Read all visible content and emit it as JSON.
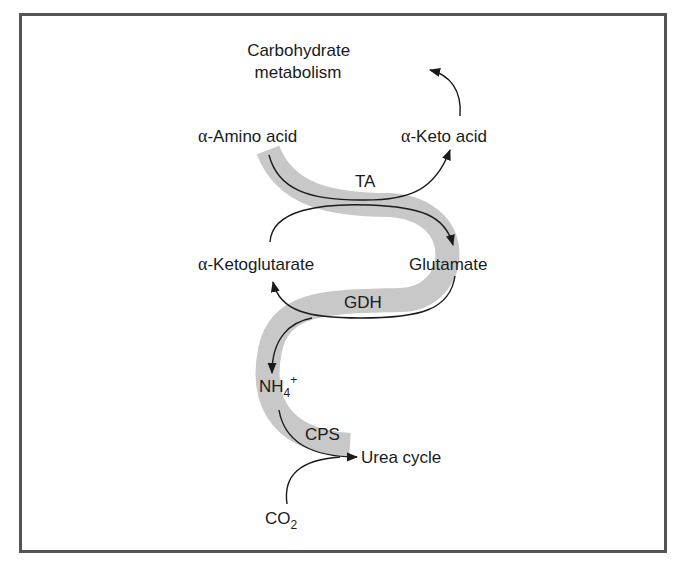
{
  "diagram": {
    "labels": {
      "carbohydrate_line1": "Carbohydrate",
      "carbohydrate_line2": "metabolism",
      "amino_acid_alpha": "α",
      "amino_acid": "-Amino acid",
      "keto_acid_alpha": "α",
      "keto_acid": "-Keto acid",
      "ta": "TA",
      "ketoglutarate_alpha": "α",
      "ketoglutarate": "-Ketoglutarate",
      "glutamate": "Glutamate",
      "gdh": "GDH",
      "nh4_base": "NH",
      "nh4_sub": "4",
      "nh4_sup": "+",
      "cps": "CPS",
      "urea_cycle": "Urea cycle",
      "co2_base": "CO",
      "co2_sub": "2"
    },
    "colors": {
      "band": "#c8c8c8",
      "arrow": "#1a1a1a",
      "frame": "#555555"
    }
  }
}
